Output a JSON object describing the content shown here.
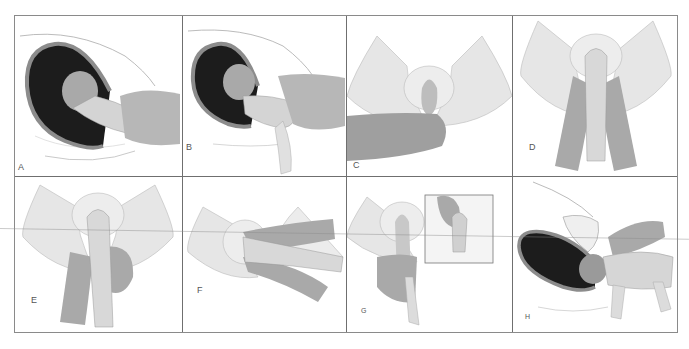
{
  "figure": {
    "panels": [
      {
        "id": "A",
        "label": "A"
      },
      {
        "id": "B",
        "label": "B"
      },
      {
        "id": "C",
        "label": "C"
      },
      {
        "id": "D",
        "label": "D"
      },
      {
        "id": "E",
        "label": "E"
      },
      {
        "id": "F",
        "label": "F"
      },
      {
        "id": "G",
        "label": "G"
      },
      {
        "id": "H",
        "label": "H"
      }
    ],
    "colors": {
      "uterus_fill": "#1c1c1c",
      "uterus_rim": "#8c8c8c",
      "skin_light": "#d9d9d9",
      "skin_mid": "#bdbdbd",
      "hand_dark": "#a6a6a6",
      "outline": "#9a9a9a"
    }
  }
}
